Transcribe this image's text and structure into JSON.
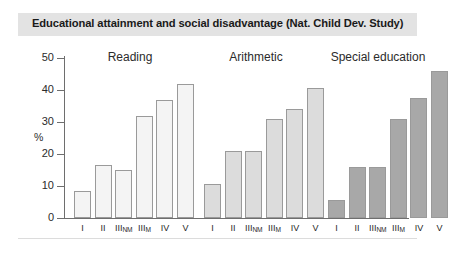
{
  "title": "Educational attainment and social disadvantage (Nat. Child Dev. Study)",
  "colors": {
    "title_band": "#e3e3e3",
    "axis": "#6e6e6e",
    "bar_border": "#9a9a9a",
    "reading_fill": "#f4f4f4",
    "arithmetic_fill": "#dcdcdc",
    "special_fill": "#a8a8a8"
  },
  "axis": {
    "y_label": "%",
    "y_ticks": [
      "0",
      "10",
      "20",
      "30",
      "40",
      "50"
    ],
    "y_tick_values": [
      0,
      10,
      20,
      30,
      40,
      50
    ]
  },
  "categories": [
    {
      "main": "I",
      "sub": ""
    },
    {
      "main": "II",
      "sub": ""
    },
    {
      "main": "III",
      "sub": "NM"
    },
    {
      "main": "III",
      "sub": "M"
    },
    {
      "main": "IV",
      "sub": ""
    },
    {
      "main": "V",
      "sub": ""
    }
  ],
  "groups": [
    {
      "label": "Reading",
      "fill": "#f4f4f4"
    },
    {
      "label": "Arithmetic",
      "fill": "#dcdcdc"
    },
    {
      "label": "Special education",
      "fill": "#a8a8a8"
    }
  ],
  "chart_data": {
    "type": "bar",
    "title": "Educational attainment and social disadvantage (Nat. Child Dev. Study)",
    "xlabel": "",
    "ylabel": "%",
    "ylim": [
      0,
      50
    ],
    "yticks": [
      0,
      10,
      20,
      30,
      40,
      50
    ],
    "grid": false,
    "legend": "none",
    "categories": [
      "I",
      "II",
      "IIINM",
      "IIIM",
      "IV",
      "V"
    ],
    "group_labels": [
      "Reading",
      "Arithmetic",
      "Special education"
    ],
    "series": [
      {
        "name": "Reading",
        "values": [
          8.5,
          16.5,
          15.0,
          32.0,
          37.0,
          42.0
        ]
      },
      {
        "name": "Arithmetic",
        "values": [
          10.5,
          21.0,
          21.0,
          31.0,
          34.0,
          40.5
        ]
      },
      {
        "name": "Special education",
        "values": [
          5.5,
          16.0,
          16.0,
          31.0,
          37.5,
          46.0
        ]
      }
    ]
  }
}
